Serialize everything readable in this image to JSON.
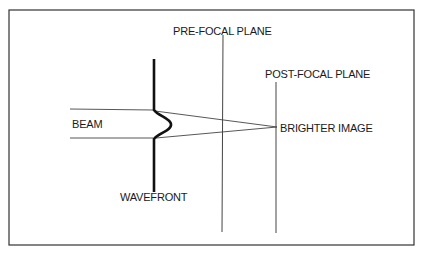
{
  "diagram": {
    "title": "",
    "labels": {
      "pre_focal_plane": "PRE-FOCAL PLANE",
      "post_focal_plane": "POST-FOCAL PLANE",
      "beam": "BEAM",
      "brighter_image": "BRIGHTER IMAGE",
      "wavefront": "WAVEFRONT"
    },
    "colors": {
      "line": "#2a2a2a",
      "background": "#ffffff"
    }
  }
}
